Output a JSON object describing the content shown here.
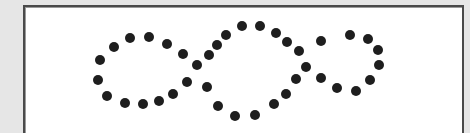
{
  "figure": {
    "background_color": "#e6e6e6",
    "frame_color": "#ffffff",
    "frame_border_color": "#4a4a4a",
    "dot_color": "#1e1e1e",
    "dot_radius": 5,
    "dots": [
      [
        100,
        60
      ],
      [
        114,
        47
      ],
      [
        130,
        38
      ],
      [
        149,
        37
      ],
      [
        167,
        44
      ],
      [
        183,
        54
      ],
      [
        197,
        65
      ],
      [
        209,
        55
      ],
      [
        217,
        45
      ],
      [
        226,
        35
      ],
      [
        98,
        80
      ],
      [
        107,
        96
      ],
      [
        125,
        103
      ],
      [
        143,
        104
      ],
      [
        159,
        101
      ],
      [
        173,
        94
      ],
      [
        187,
        82
      ],
      [
        207,
        87
      ],
      [
        218,
        106
      ],
      [
        235,
        116
      ],
      [
        242,
        26
      ],
      [
        260,
        26
      ],
      [
        276,
        33
      ],
      [
        287,
        42
      ],
      [
        299,
        51
      ],
      [
        321,
        41
      ],
      [
        350,
        35
      ],
      [
        368,
        39
      ],
      [
        378,
        50
      ],
      [
        379,
        65
      ],
      [
        370,
        80
      ],
      [
        356,
        91
      ],
      [
        337,
        88
      ],
      [
        321,
        78
      ],
      [
        306,
        67
      ],
      [
        296,
        79
      ],
      [
        286,
        94
      ],
      [
        274,
        104
      ],
      [
        255,
        115
      ]
    ]
  }
}
